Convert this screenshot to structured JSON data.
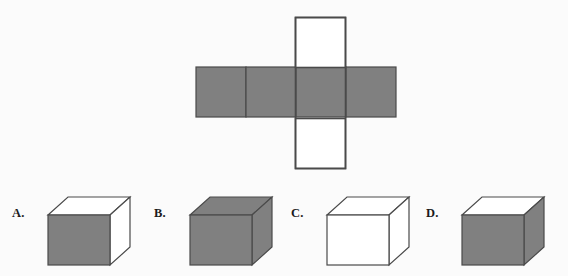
{
  "page": {
    "type": "geometry-multiple-choice-question",
    "background_color": "#fbfbfb",
    "gray_fill": "#808080",
    "white_fill": "#ffffff",
    "stroke_color": "#4a4a4a",
    "label_color": "#1b1b1b"
  },
  "net": {
    "name": "cube-net",
    "description": "Cross-shaped cube net: horizontal strip of four squares plus a vertical strip of three squares overlapping the third square",
    "square_size": 50,
    "horizontal_strip": {
      "x": 196,
      "y": 67,
      "squares": [
        {
          "index": 1,
          "fill": "gray"
        },
        {
          "index": 2,
          "fill": "gray"
        },
        {
          "index": 3,
          "fill": "gray"
        },
        {
          "index": 4,
          "fill": "gray"
        }
      ]
    },
    "vertical_strip": {
      "x": 295,
      "y": 17,
      "squares": [
        {
          "index": 1,
          "fill": "white"
        },
        {
          "index": 2,
          "fill": "overlap"
        },
        {
          "index": 3,
          "fill": "white"
        }
      ]
    }
  },
  "options": [
    {
      "key": "A",
      "label": "A.",
      "name": "option-a",
      "left": 6,
      "faces": {
        "front": "gray",
        "top": "white",
        "right": "white"
      }
    },
    {
      "key": "B",
      "label": "B.",
      "name": "option-b",
      "left": 148,
      "faces": {
        "front": "gray",
        "top": "gray",
        "right": "gray"
      }
    },
    {
      "key": "C",
      "label": "C.",
      "name": "option-c",
      "left": 285,
      "faces": {
        "front": "white",
        "top": "white",
        "right": "white"
      }
    },
    {
      "key": "D",
      "label": "D.",
      "name": "option-d",
      "left": 420,
      "faces": {
        "front": "gray",
        "top": "white",
        "right": "gray"
      }
    }
  ]
}
